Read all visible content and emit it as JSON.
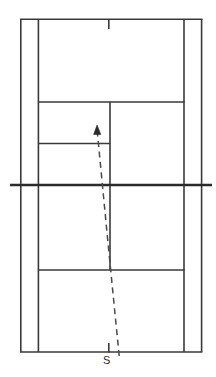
{
  "diagram": {
    "type": "tennis-court-plan",
    "orientation": "vertical",
    "labels": {
      "serve_origin": "S"
    },
    "colors": {
      "line": "#3a3a3a",
      "net": "#2b2b2b",
      "shot_path": "#4a4a4a",
      "arrow": "#2b2b2b",
      "background": "#ffffff",
      "label_text": "#2b2b2b"
    },
    "geometry": {
      "width": 216,
      "height": 377,
      "outer_left_x": 20,
      "outer_right_x": 202,
      "inner_left_x": 38,
      "inner_right_x": 184,
      "center_line_x": 110,
      "top_baseline_y": 19,
      "bottom_baseline_y": 352,
      "net_y": 185,
      "net_left_x": 10,
      "net_right_x": 212,
      "top_service_line_y": 102,
      "bottom_service_line_y": 270,
      "extra_left_line_y": 143
    },
    "elements": [
      {
        "name": "outer-left-sideline",
        "kind": "vertical-line"
      },
      {
        "name": "outer-right-sideline",
        "kind": "vertical-line"
      },
      {
        "name": "inner-left-sideline",
        "kind": "vertical-line"
      },
      {
        "name": "inner-right-sideline",
        "kind": "vertical-line"
      },
      {
        "name": "top-baseline",
        "kind": "horizontal-line"
      },
      {
        "name": "bottom-baseline",
        "kind": "horizontal-line"
      },
      {
        "name": "top-service-line",
        "kind": "horizontal-line"
      },
      {
        "name": "bottom-service-line",
        "kind": "horizontal-line"
      },
      {
        "name": "extra-left-horizontal-line",
        "kind": "horizontal-line"
      },
      {
        "name": "center-service-line",
        "kind": "vertical-line"
      },
      {
        "name": "net-line",
        "kind": "horizontal-line-thick"
      },
      {
        "name": "top-center-mark",
        "kind": "tick"
      },
      {
        "name": "bottom-center-mark",
        "kind": "tick"
      },
      {
        "name": "serve-trajectory",
        "kind": "dashed-path"
      },
      {
        "name": "trajectory-arrowhead",
        "kind": "arrow"
      }
    ],
    "shot": {
      "description": "Dashed serve trajectory from S at the baseline to an arrow tip inside the far service box",
      "start_x": 119,
      "start_y": 355,
      "bend_x": 108,
      "bend_y": 245,
      "end_x": 97,
      "end_y": 132,
      "arrow_tip_x": 97,
      "arrow_tip_y": 126
    }
  }
}
